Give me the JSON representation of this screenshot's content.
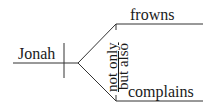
{
  "diagram": {
    "type": "sentence-diagram",
    "subject": "Jonah",
    "conjunction": {
      "part1": "not only",
      "part2": "but also"
    },
    "predicates": [
      "frowns",
      "complains"
    ],
    "colors": {
      "line": "#333333",
      "text": "#1a1a1a",
      "background": "#ffffff"
    }
  }
}
